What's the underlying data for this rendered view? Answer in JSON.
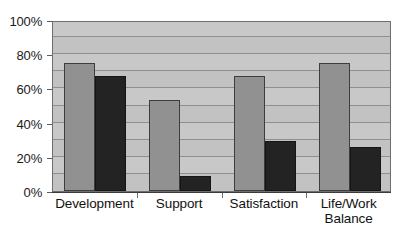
{
  "chart_data": {
    "type": "bar",
    "title": "",
    "subtitle": "",
    "xlabel": "",
    "ylabel": "",
    "categories": [
      "Development",
      "Support",
      "Satisfaction",
      "Life/Work\nBalance"
    ],
    "series": [
      {
        "name": "Series 1",
        "color": "#919191",
        "values": [
          75,
          53,
          67,
          75
        ]
      },
      {
        "name": "Series 2",
        "color": "#232323",
        "values": [
          67,
          9,
          29,
          26
        ]
      }
    ],
    "ylim": [
      0,
      100
    ],
    "y_tick_labels": [
      "0%",
      "20%",
      "40%",
      "60%",
      "80%",
      "100%"
    ],
    "y_tick_values": [
      0,
      20,
      40,
      60,
      80,
      100
    ],
    "gridline_values": [
      10,
      20,
      30,
      40,
      50,
      60,
      70,
      80,
      90
    ],
    "grid": true,
    "legend": "none",
    "plot_background": "#c2c2c2",
    "axis_color": "#3b3b3b"
  }
}
